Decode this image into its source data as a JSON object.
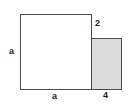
{
  "figure": {
    "background_color": "#ffffff",
    "stroke_color": "#4a4a4a",
    "shaded_fill_color": "#dcdcdc",
    "unshaded_fill_color": "#ffffff",
    "label_color": "#1a1a1a",
    "shapes": [
      {
        "name": "big-square",
        "kind": "square",
        "shaded": false,
        "fill": "#ffffff"
      },
      {
        "name": "small-rect",
        "kind": "rectangle",
        "shaded": true,
        "fill": "#dcdcdc"
      }
    ],
    "labels": {
      "left_side": "a",
      "bottom_side": "a",
      "rect_height": "2",
      "rect_width": "4"
    }
  }
}
